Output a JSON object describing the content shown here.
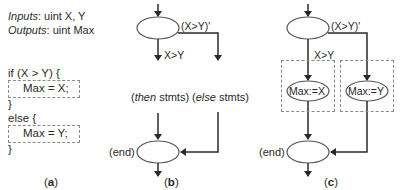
{
  "panel_a": {
    "inputs_label": "Inputs",
    "inputs_value": ": uint X, Y",
    "outputs_label": "Outputs",
    "outputs_value": ": uint Max",
    "if_line": "if (X > Y) {",
    "then_stmt": "Max = X;",
    "close_then": "}",
    "else_line": "else {",
    "else_stmt": "Max = Y;",
    "close_else": "}",
    "caption_open": "(",
    "caption_letter": "a",
    "caption_close": ")"
  },
  "panel_b": {
    "false_label": "(X>Y)'",
    "true_label": "X>Y",
    "then_open": "(",
    "then_italic": "then",
    "then_rest": " stmts)",
    "else_open": "(",
    "else_italic": "else",
    "else_rest": " stmts)",
    "end_label": "(end)",
    "caption_open": "(",
    "caption_letter": "b",
    "caption_close": ")"
  },
  "panel_c": {
    "false_label": "(X>Y)'",
    "true_label": "X>Y",
    "then_node": "Max:=X",
    "else_node": "Max:=Y",
    "end_label": "(end)",
    "caption_open": "(",
    "caption_letter": "c",
    "caption_close": ")"
  },
  "colors": {
    "line": "#2a2a2a",
    "ellipse_stroke": "#555555",
    "dashed_box": "#8a8a8a"
  }
}
